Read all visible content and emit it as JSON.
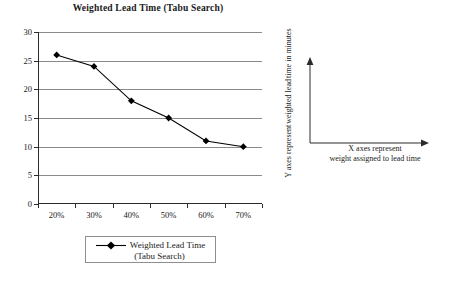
{
  "chart_data": {
    "type": "line",
    "title": "Weighted Lead Time (Tabu Search)",
    "categories": [
      "20%",
      "30%",
      "40%",
      "50%",
      "60%",
      "70%"
    ],
    "values": [
      26,
      24,
      18,
      15,
      11,
      10
    ],
    "series": [
      {
        "name": "Weighted Lead Time (Tabu Search)",
        "values": [
          26,
          24,
          18,
          15,
          11,
          10
        ]
      }
    ],
    "xlabel": "",
    "ylabel": "",
    "ylim": [
      0,
      30
    ],
    "yticks": [
      0,
      5,
      10,
      15,
      20,
      25,
      30
    ],
    "ytick_labels": [
      "0",
      "5",
      "10",
      "15",
      "20",
      "25",
      "30"
    ],
    "grid": true,
    "legend_position": "bottom",
    "marker": "diamond",
    "line_color": "#000000",
    "grid_color": "#8a8a8a",
    "axis_color": "#2b2b2b"
  },
  "legend": {
    "line1": "Weighted Lead Time",
    "line2": "(Tabu Search)"
  },
  "axis_diagram": {
    "y_caption_lines": [
      "Y axes represent",
      "weighted lead",
      "time in minutes"
    ],
    "x_caption_lines": [
      "X axes represent",
      "weight assigned to lead time"
    ]
  }
}
